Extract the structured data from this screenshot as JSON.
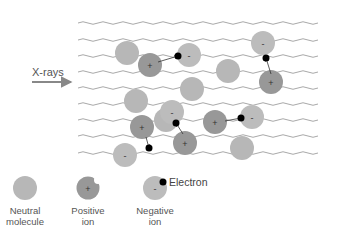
{
  "diagram": {
    "source_label": "X-rays",
    "colors": {
      "neutral": "#b7b7b7",
      "positive": "#989898",
      "negative": "#bcbcbc",
      "electron": "#000000",
      "wave": "#a9a9a9",
      "text": "#555555"
    },
    "wave_lines_y": [
      23,
      40,
      56,
      72,
      88,
      104,
      120,
      136,
      153
    ],
    "molecules": [
      {
        "type": "neutral",
        "x": 127,
        "y": 53
      },
      {
        "type": "positive",
        "x": 150,
        "y": 65
      },
      {
        "type": "negative",
        "x": 189,
        "y": 55
      },
      {
        "type": "neutral",
        "x": 228,
        "y": 71
      },
      {
        "type": "negative",
        "x": 263,
        "y": 43
      },
      {
        "type": "positive",
        "x": 271,
        "y": 82
      },
      {
        "type": "neutral",
        "x": 136,
        "y": 101
      },
      {
        "type": "neutral",
        "x": 192,
        "y": 89
      },
      {
        "type": "neutral",
        "x": 166,
        "y": 120
      },
      {
        "type": "positive",
        "x": 142,
        "y": 127
      },
      {
        "type": "negative",
        "x": 172,
        "y": 112
      },
      {
        "type": "positive",
        "x": 185,
        "y": 143
      },
      {
        "type": "negative",
        "x": 125,
        "y": 155
      },
      {
        "type": "positive",
        "x": 215,
        "y": 122
      },
      {
        "type": "negative",
        "x": 252,
        "y": 117
      },
      {
        "type": "neutral",
        "x": 242,
        "y": 148
      }
    ],
    "electrons": [
      {
        "x": 178,
        "y": 56,
        "from": [
          158,
          62
        ]
      },
      {
        "x": 266,
        "y": 58,
        "from": [
          271,
          74
        ]
      },
      {
        "x": 176,
        "y": 123,
        "from": [
          183,
          134
        ]
      },
      {
        "x": 149,
        "y": 148,
        "from": [
          146,
          137
        ]
      },
      {
        "x": 241,
        "y": 118,
        "from": [
          225,
          121
        ]
      }
    ],
    "legend": {
      "neutral": {
        "line1": "Neutral",
        "line2": "molecule"
      },
      "positive": {
        "line1": "Positive",
        "line2": "ion"
      },
      "negative": {
        "line1": "Negative",
        "line2": "ion"
      },
      "electron": "Electron",
      "plus_symbol": "+",
      "minus_symbol": "-"
    }
  }
}
